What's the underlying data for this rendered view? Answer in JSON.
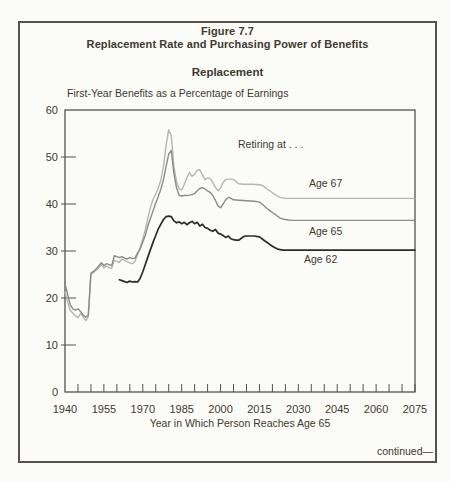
{
  "figure": {
    "number": "Figure 7.7",
    "title": "Replacement Rate and Purchasing Power of Benefits",
    "panel_title": "Replacement",
    "continued": "continued—"
  },
  "chart_data": {
    "type": "line",
    "title": "Replacement",
    "subtitle": "First-Year Benefits as a Percentage of Earnings",
    "annotation": "Retiring at . . .",
    "xlabel": "Year in Which Person Reaches Age 65",
    "ylabel": "First-Year Benefits as a Percentage of Earnings",
    "grid": false,
    "legend_position": "inline-right-of-lines",
    "x_axis": {
      "min": 1940,
      "max": 2075,
      "tick_step": 5,
      "labels": [
        1940,
        1955,
        1970,
        1985,
        2000,
        2015,
        2030,
        2045,
        2060,
        2075
      ]
    },
    "y_axis": {
      "min": 0,
      "max": 60,
      "tick_step": 10,
      "labels": [
        0,
        10,
        20,
        30,
        40,
        50,
        60
      ]
    },
    "frame_color": "#55524a",
    "series": [
      {
        "name": "Age 67",
        "color": "#b5b5b5",
        "width": 1.4,
        "points": [
          [
            1940,
            21.3
          ],
          [
            1941,
            19.2
          ],
          [
            1942,
            17.4
          ],
          [
            1943,
            16.8
          ],
          [
            1944,
            16.2
          ],
          [
            1945,
            15.8
          ],
          [
            1946,
            16.7
          ],
          [
            1947,
            16.0
          ],
          [
            1948,
            15.2
          ],
          [
            1949,
            16.0
          ],
          [
            1950,
            25.0
          ],
          [
            1951,
            25.4
          ],
          [
            1952,
            25.9
          ],
          [
            1953,
            26.4
          ],
          [
            1954,
            27.1
          ],
          [
            1955,
            26.4
          ],
          [
            1956,
            26.8
          ],
          [
            1957,
            26.4
          ],
          [
            1958,
            26.3
          ],
          [
            1959,
            28.0
          ],
          [
            1960,
            27.8
          ],
          [
            1961,
            27.6
          ],
          [
            1962,
            28.3
          ],
          [
            1963,
            28.0
          ],
          [
            1964,
            27.7
          ],
          [
            1965,
            27.5
          ],
          [
            1966,
            27.3
          ],
          [
            1967,
            27.8
          ],
          [
            1968,
            29.2
          ],
          [
            1969,
            30.8
          ],
          [
            1970,
            32.6
          ],
          [
            1971,
            34.6
          ],
          [
            1972,
            37.2
          ],
          [
            1973,
            39.4
          ],
          [
            1974,
            41.0
          ],
          [
            1975,
            42.1
          ],
          [
            1976,
            43.4
          ],
          [
            1977,
            45.2
          ],
          [
            1978,
            48.0
          ],
          [
            1979,
            52.5
          ],
          [
            1980,
            55.8
          ],
          [
            1981,
            54.5
          ],
          [
            1982,
            48.0
          ],
          [
            1983,
            44.8
          ],
          [
            1984,
            43.2
          ],
          [
            1985,
            43.0
          ],
          [
            1986,
            44.2
          ],
          [
            1987,
            45.6
          ],
          [
            1988,
            46.7
          ],
          [
            1989,
            45.9
          ],
          [
            1990,
            46.3
          ],
          [
            1991,
            47.2
          ],
          [
            1992,
            47.3
          ],
          [
            1993,
            46.2
          ],
          [
            1994,
            45.2
          ],
          [
            1995,
            45.6
          ],
          [
            1996,
            45.4
          ],
          [
            1997,
            44.6
          ],
          [
            1998,
            43.6
          ],
          [
            1999,
            42.8
          ],
          [
            2000,
            43.4
          ],
          [
            2001,
            44.6
          ],
          [
            2002,
            45.2
          ],
          [
            2003,
            45.3
          ],
          [
            2004,
            45.3
          ],
          [
            2005,
            45.2
          ],
          [
            2006,
            44.8
          ],
          [
            2007,
            44.3
          ],
          [
            2009,
            44.2
          ],
          [
            2012,
            44.2
          ],
          [
            2015,
            44.1
          ],
          [
            2016,
            44.0
          ],
          [
            2017,
            43.6
          ],
          [
            2018,
            43.2
          ],
          [
            2019,
            42.8
          ],
          [
            2020,
            42.4
          ],
          [
            2021,
            42.0
          ],
          [
            2022,
            41.7
          ],
          [
            2023,
            41.4
          ],
          [
            2024,
            41.3
          ],
          [
            2025,
            41.2
          ],
          [
            2075,
            41.2
          ]
        ]
      },
      {
        "name": "Age 65",
        "color": "#8b8b8b",
        "width": 1.4,
        "points": [
          [
            1940,
            23.0
          ],
          [
            1941,
            20.8
          ],
          [
            1942,
            18.6
          ],
          [
            1943,
            17.7
          ],
          [
            1944,
            17.4
          ],
          [
            1945,
            17.7
          ],
          [
            1946,
            17.1
          ],
          [
            1947,
            16.4
          ],
          [
            1948,
            15.9
          ],
          [
            1949,
            16.4
          ],
          [
            1950,
            25.3
          ],
          [
            1951,
            25.7
          ],
          [
            1952,
            26.2
          ],
          [
            1953,
            26.8
          ],
          [
            1954,
            27.5
          ],
          [
            1955,
            26.9
          ],
          [
            1956,
            27.3
          ],
          [
            1957,
            27.1
          ],
          [
            1958,
            26.9
          ],
          [
            1959,
            29.0
          ],
          [
            1960,
            28.8
          ],
          [
            1961,
            28.6
          ],
          [
            1962,
            28.8
          ],
          [
            1963,
            28.5
          ],
          [
            1964,
            28.3
          ],
          [
            1965,
            28.6
          ],
          [
            1966,
            28.4
          ],
          [
            1967,
            28.5
          ],
          [
            1968,
            29.6
          ],
          [
            1969,
            30.4
          ],
          [
            1970,
            31.9
          ],
          [
            1971,
            33.4
          ],
          [
            1972,
            35.4
          ],
          [
            1973,
            37.0
          ],
          [
            1974,
            38.6
          ],
          [
            1975,
            40.2
          ],
          [
            1976,
            41.6
          ],
          [
            1977,
            43.2
          ],
          [
            1978,
            45.2
          ],
          [
            1979,
            48.0
          ],
          [
            1980,
            50.6
          ],
          [
            1981,
            51.4
          ],
          [
            1982,
            46.5
          ],
          [
            1983,
            43.5
          ],
          [
            1984,
            41.8
          ],
          [
            1985,
            41.7
          ],
          [
            1986,
            41.8
          ],
          [
            1987,
            41.8
          ],
          [
            1988,
            41.9
          ],
          [
            1989,
            42.0
          ],
          [
            1990,
            42.2
          ],
          [
            1991,
            42.8
          ],
          [
            1992,
            43.3
          ],
          [
            1993,
            43.5
          ],
          [
            1994,
            43.2
          ],
          [
            1995,
            42.8
          ],
          [
            1996,
            42.5
          ],
          [
            1997,
            41.8
          ],
          [
            1998,
            40.8
          ],
          [
            1999,
            39.6
          ],
          [
            2000,
            39.2
          ],
          [
            2001,
            40.0
          ],
          [
            2002,
            40.9
          ],
          [
            2003,
            41.4
          ],
          [
            2004,
            41.2
          ],
          [
            2005,
            40.9
          ],
          [
            2007,
            40.8
          ],
          [
            2010,
            40.7
          ],
          [
            2013,
            40.6
          ],
          [
            2015,
            40.4
          ],
          [
            2016,
            40.0
          ],
          [
            2017,
            39.5
          ],
          [
            2018,
            39.0
          ],
          [
            2019,
            38.6
          ],
          [
            2020,
            38.2
          ],
          [
            2021,
            37.8
          ],
          [
            2022,
            37.4
          ],
          [
            2023,
            37.0
          ],
          [
            2024,
            36.8
          ],
          [
            2026,
            36.6
          ],
          [
            2028,
            36.5
          ],
          [
            2075,
            36.5
          ]
        ]
      },
      {
        "name": "Age 62",
        "color": "#2b2b2b",
        "width": 1.7,
        "points": [
          [
            1961,
            23.9
          ],
          [
            1962,
            23.7
          ],
          [
            1963,
            23.5
          ],
          [
            1964,
            23.3
          ],
          [
            1965,
            23.6
          ],
          [
            1966,
            23.4
          ],
          [
            1967,
            23.5
          ],
          [
            1968,
            23.4
          ],
          [
            1969,
            24.2
          ],
          [
            1970,
            25.6
          ],
          [
            1971,
            27.2
          ],
          [
            1972,
            28.8
          ],
          [
            1973,
            30.4
          ],
          [
            1974,
            31.9
          ],
          [
            1975,
            33.3
          ],
          [
            1976,
            34.7
          ],
          [
            1977,
            35.7
          ],
          [
            1978,
            36.7
          ],
          [
            1979,
            37.3
          ],
          [
            1980,
            37.4
          ],
          [
            1981,
            37.3
          ],
          [
            1982,
            36.4
          ],
          [
            1983,
            36.0
          ],
          [
            1984,
            36.2
          ],
          [
            1985,
            35.8
          ],
          [
            1986,
            36.1
          ],
          [
            1987,
            35.6
          ],
          [
            1988,
            36.0
          ],
          [
            1989,
            36.3
          ],
          [
            1990,
            35.8
          ],
          [
            1991,
            36.1
          ],
          [
            1992,
            35.3
          ],
          [
            1993,
            35.7
          ],
          [
            1994,
            35.0
          ],
          [
            1995,
            34.8
          ],
          [
            1996,
            34.4
          ],
          [
            1997,
            34.2
          ],
          [
            1998,
            34.6
          ],
          [
            1999,
            33.8
          ],
          [
            2000,
            33.6
          ],
          [
            2001,
            33.3
          ],
          [
            2002,
            32.9
          ],
          [
            2003,
            33.2
          ],
          [
            2004,
            32.6
          ],
          [
            2005,
            32.4
          ],
          [
            2006,
            32.3
          ],
          [
            2007,
            32.3
          ],
          [
            2008,
            32.7
          ],
          [
            2009,
            33.1
          ],
          [
            2010,
            33.2
          ],
          [
            2013,
            33.2
          ],
          [
            2015,
            33.0
          ],
          [
            2016,
            32.6
          ],
          [
            2017,
            32.2
          ],
          [
            2018,
            31.8
          ],
          [
            2019,
            31.4
          ],
          [
            2020,
            31.0
          ],
          [
            2021,
            30.7
          ],
          [
            2022,
            30.4
          ],
          [
            2023,
            30.3
          ],
          [
            2024,
            30.2
          ],
          [
            2075,
            30.2
          ]
        ]
      }
    ]
  }
}
